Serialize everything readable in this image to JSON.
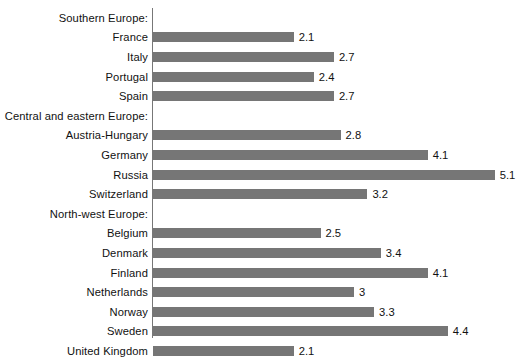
{
  "chart_data": {
    "type": "bar",
    "orientation": "horizontal",
    "title": "",
    "xlabel": "",
    "ylabel": "",
    "xlim": [
      0,
      5.6
    ],
    "grid": false,
    "legend": null,
    "bar_color": "#767676",
    "axis_color": "#777777",
    "background": "#ffffff",
    "value_labels_shown": true,
    "categories": [
      "Southern Europe:",
      "France",
      "Italy",
      "Portugal",
      "Spain",
      "Central and eastern Europe:",
      "Austria-Hungary",
      "Germany",
      "Russia",
      "Switzerland",
      "North-west Europe:",
      "Belgium",
      "Denmark",
      "Finland",
      "Netherlands",
      "Norway",
      "Sweden",
      "United Kingdom"
    ],
    "rows": [
      {
        "label": "Southern Europe:",
        "is_group_header": true,
        "value": null,
        "value_label": ""
      },
      {
        "label": "France",
        "is_group_header": false,
        "value": 2.1,
        "value_label": "2.1"
      },
      {
        "label": "Italy",
        "is_group_header": false,
        "value": 2.7,
        "value_label": "2.7"
      },
      {
        "label": "Portugal",
        "is_group_header": false,
        "value": 2.4,
        "value_label": "2.4"
      },
      {
        "label": "Spain",
        "is_group_header": false,
        "value": 2.7,
        "value_label": "2.7"
      },
      {
        "label": "Central and eastern Europe:",
        "is_group_header": true,
        "value": null,
        "value_label": ""
      },
      {
        "label": "Austria-Hungary",
        "is_group_header": false,
        "value": 2.8,
        "value_label": "2.8"
      },
      {
        "label": "Germany",
        "is_group_header": false,
        "value": 4.1,
        "value_label": "4.1"
      },
      {
        "label": "Russia",
        "is_group_header": false,
        "value": 5.1,
        "value_label": "5.1"
      },
      {
        "label": "Switzerland",
        "is_group_header": false,
        "value": 3.2,
        "value_label": "3.2"
      },
      {
        "label": "North-west Europe:",
        "is_group_header": true,
        "value": null,
        "value_label": ""
      },
      {
        "label": "Belgium",
        "is_group_header": false,
        "value": 2.5,
        "value_label": "2.5"
      },
      {
        "label": "Denmark",
        "is_group_header": false,
        "value": 3.4,
        "value_label": "3.4"
      },
      {
        "label": "Finland",
        "is_group_header": false,
        "value": 4.1,
        "value_label": "4.1"
      },
      {
        "label": "Netherlands",
        "is_group_header": false,
        "value": 3,
        "value_label": "3"
      },
      {
        "label": "Norway",
        "is_group_header": false,
        "value": 3.3,
        "value_label": "3.3"
      },
      {
        "label": "Sweden",
        "is_group_header": false,
        "value": 4.4,
        "value_label": "4.4"
      },
      {
        "label": "United Kingdom",
        "is_group_header": false,
        "value": 2.1,
        "value_label": "2.1"
      }
    ],
    "values": [
      null,
      2.1,
      2.7,
      2.4,
      2.7,
      null,
      2.8,
      4.1,
      5.1,
      3.2,
      null,
      2.5,
      3.4,
      4.1,
      3,
      3.3,
      4.4,
      2.1
    ]
  },
  "layout": {
    "axis_x_px": 152,
    "row_pitch_px": 19.6,
    "first_row_top_px": 8,
    "px_per_unit": 67,
    "bar_height_px": 10
  }
}
